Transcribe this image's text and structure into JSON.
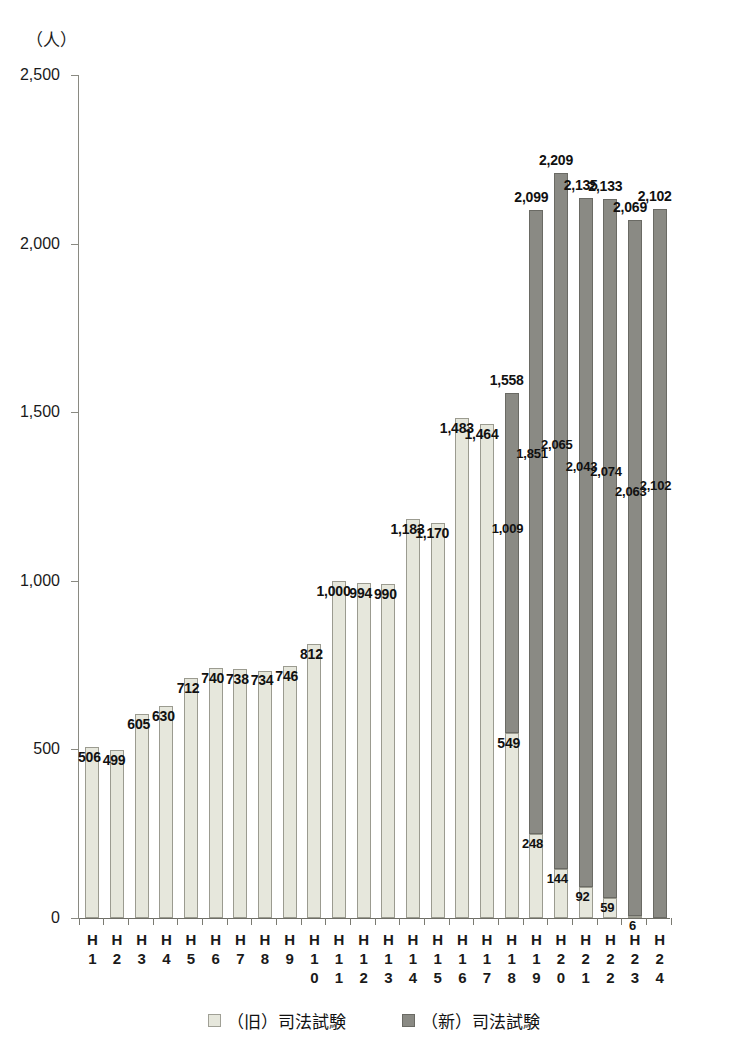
{
  "chart_data": {
    "type": "bar",
    "stacked": true,
    "title": "",
    "subtitle": "",
    "unit_label": "（人）",
    "xlabel": "",
    "ylabel": "",
    "ylim": [
      0,
      2500
    ],
    "yticks": [
      "0",
      "500",
      "1,000",
      "1,500",
      "2,000",
      "2,500"
    ],
    "ytick_values": [
      0,
      500,
      1000,
      1500,
      2000,
      2500
    ],
    "grid": false,
    "legend_position": "bottom",
    "categories": [
      "H1",
      "H2",
      "H3",
      "H4",
      "H5",
      "H6",
      "H7",
      "H8",
      "H9",
      "H10",
      "H11",
      "H12",
      "H13",
      "H14",
      "H15",
      "H16",
      "H17",
      "H18",
      "H19",
      "H20",
      "H21",
      "H22",
      "H23",
      "H24"
    ],
    "category_lines": [
      [
        "H",
        "1"
      ],
      [
        "H",
        "2"
      ],
      [
        "H",
        "3"
      ],
      [
        "H",
        "4"
      ],
      [
        "H",
        "5"
      ],
      [
        "H",
        "6"
      ],
      [
        "H",
        "7"
      ],
      [
        "H",
        "8"
      ],
      [
        "H",
        "9"
      ],
      [
        "H",
        "1",
        "0"
      ],
      [
        "H",
        "1",
        "1"
      ],
      [
        "H",
        "1",
        "2"
      ],
      [
        "H",
        "1",
        "3"
      ],
      [
        "H",
        "1",
        "4"
      ],
      [
        "H",
        "1",
        "5"
      ],
      [
        "H",
        "1",
        "6"
      ],
      [
        "H",
        "1",
        "7"
      ],
      [
        "H",
        "1",
        "8"
      ],
      [
        "H",
        "1",
        "9"
      ],
      [
        "H",
        "2",
        "0"
      ],
      [
        "H",
        "2",
        "1"
      ],
      [
        "H",
        "2",
        "2"
      ],
      [
        "H",
        "2",
        "3"
      ],
      [
        "H",
        "2",
        "4"
      ]
    ],
    "series": [
      {
        "name": "（旧）司法試験",
        "key": "old",
        "color": "#e6e7dc",
        "values": [
          506,
          499,
          605,
          630,
          712,
          740,
          738,
          734,
          746,
          812,
          1000,
          994,
          990,
          1183,
          1170,
          1483,
          1464,
          549,
          248,
          144,
          92,
          59,
          6,
          0
        ],
        "labels": [
          "506",
          "499",
          "605",
          "630",
          "712",
          "740",
          "738",
          "734",
          "746",
          "812",
          "1,000",
          "994",
          "990",
          "1,183",
          "1,170",
          "1,483",
          "1,464",
          "549",
          "248",
          "144",
          "92",
          "59",
          "6",
          ""
        ]
      },
      {
        "name": "（新）司法試験",
        "key": "new",
        "color": "#8a8a84",
        "values": [
          0,
          0,
          0,
          0,
          0,
          0,
          0,
          0,
          0,
          0,
          0,
          0,
          0,
          0,
          0,
          0,
          0,
          1009,
          1851,
          2065,
          2043,
          2074,
          2063,
          2102
        ],
        "labels": [
          "",
          "",
          "",
          "",
          "",
          "",
          "",
          "",
          "",
          "",
          "",
          "",
          "",
          "",
          "",
          "",
          "",
          "1,009",
          "1,851",
          "2,065",
          "2,043",
          "2,074",
          "2,063",
          "2,102"
        ]
      }
    ],
    "totals": [
      506,
      499,
      605,
      630,
      712,
      740,
      738,
      734,
      746,
      812,
      1000,
      994,
      990,
      1183,
      1170,
      1483,
      1464,
      1558,
      2099,
      2209,
      2135,
      2133,
      2069,
      2102
    ],
    "total_labels": [
      "",
      "",
      "",
      "",
      "",
      "",
      "",
      "",
      "",
      "",
      "",
      "",
      "",
      "",
      "",
      "",
      "",
      "1,558",
      "2,099",
      "2,209",
      "2,135",
      "2,133",
      "2,069",
      "2,102"
    ]
  },
  "legend": {
    "items": [
      {
        "label": "（旧）司法試験",
        "swatch": "light-square-swatch"
      },
      {
        "label": "（新）司法試験",
        "swatch": "dark-square-swatch"
      }
    ]
  },
  "colors": {
    "old_exam": "#e6e7dc",
    "new_exam": "#8a8a84",
    "axis": "#6e6e66",
    "text": "#1a1a1a",
    "background": "#ffffff"
  }
}
